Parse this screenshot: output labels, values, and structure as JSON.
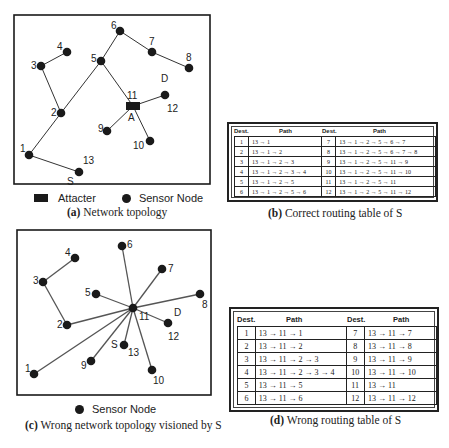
{
  "figure_a": {
    "label": "(a)",
    "caption": "Network topology",
    "legend": {
      "attacker_label": "Attacter",
      "sensor_label": "Sensor Node"
    },
    "nodes": [
      {
        "id": "1",
        "x": 29,
        "y": 155,
        "label": "1",
        "lx": -9,
        "ly": -6
      },
      {
        "id": "2",
        "x": 61,
        "y": 113,
        "label": "2",
        "lx": -10,
        "ly": 0
      },
      {
        "id": "3",
        "x": 41,
        "y": 66,
        "label": "3",
        "lx": -10,
        "ly": 0
      },
      {
        "id": "4",
        "x": 67,
        "y": 52,
        "label": "4",
        "lx": -10,
        "ly": -5
      },
      {
        "id": "5",
        "x": 101,
        "y": 61,
        "label": "5",
        "lx": -10,
        "ly": -2
      },
      {
        "id": "6",
        "x": 120,
        "y": 31,
        "label": "6",
        "lx": -9,
        "ly": -5
      },
      {
        "id": "7",
        "x": 152,
        "y": 52,
        "label": "7",
        "lx": -3,
        "ly": -10
      },
      {
        "id": "8",
        "x": 189,
        "y": 68,
        "label": "8",
        "lx": -3,
        "ly": -10
      },
      {
        "id": "9",
        "x": 107,
        "y": 131,
        "label": "9",
        "lx": -9,
        "ly": -2
      },
      {
        "id": "10",
        "x": 150,
        "y": 141,
        "label": "10",
        "lx": -17,
        "ly": 5
      },
      {
        "id": "12",
        "x": 165,
        "y": 95,
        "label": "12",
        "lx": 2,
        "ly": 14
      },
      {
        "id": "13",
        "x": 79,
        "y": 172,
        "label": "13",
        "lx": 4,
        "ly": -11
      }
    ],
    "attacker": {
      "id": "11",
      "x": 133,
      "y": 106,
      "label": "11",
      "sub": "A"
    },
    "extra_labels": [
      {
        "text": "D",
        "x": 161,
        "y": 82
      },
      {
        "text": "S",
        "x": 67,
        "y": 185
      }
    ],
    "edges": [
      [
        "13",
        "1"
      ],
      [
        "1",
        "2"
      ],
      [
        "2",
        "3"
      ],
      [
        "3",
        "4"
      ],
      [
        "2",
        "5"
      ],
      [
        "5",
        "6"
      ],
      [
        "6",
        "7"
      ],
      [
        "7",
        "8"
      ],
      [
        "5",
        "11"
      ],
      [
        "11",
        "12"
      ],
      [
        "11",
        "9"
      ],
      [
        "11",
        "10"
      ]
    ]
  },
  "figure_b": {
    "label": "(b)",
    "caption": "Correct routing table of S",
    "headers": {
      "dest": "Dest.",
      "path": "Path"
    },
    "left_rows": [
      {
        "dest": "1",
        "path": "13 → 1"
      },
      {
        "dest": "2",
        "path": "13 → 1 → 2"
      },
      {
        "dest": "3",
        "path": "13 → 1 → 2 → 3"
      },
      {
        "dest": "4",
        "path": "13 → 1 → 2 → 3 → 4"
      },
      {
        "dest": "5",
        "path": "13 → 1 → 2 → 5"
      },
      {
        "dest": "6",
        "path": "13 → 1 → 2 → 5 → 6"
      }
    ],
    "right_rows": [
      {
        "dest": "7",
        "path": "13 → 1 → 2 → 5 → 6 → 7"
      },
      {
        "dest": "8",
        "path": "13 → 1 → 2 → 5 → 6 → 7 → 8"
      },
      {
        "dest": "9",
        "path": "13 → 1 → 2 → 5 → 11 → 9"
      },
      {
        "dest": "10",
        "path": "13 → 1 → 2 → 5 → 11 → 10"
      },
      {
        "dest": "11",
        "path": "13 → 1 → 2 → 5 → 11"
      },
      {
        "dest": "12",
        "path": "13 → 1 → 2 → 5 → 11 → 12"
      }
    ]
  },
  "figure_c": {
    "label": "(c)",
    "caption": "Wrong network topology visioned by S",
    "legend": {
      "sensor_label": "Sensor Node"
    },
    "nodes": [
      {
        "id": "1",
        "x": 34,
        "y": 374,
        "label": "1",
        "lx": -9,
        "ly": -5
      },
      {
        "id": "2",
        "x": 67,
        "y": 325,
        "label": "2",
        "lx": -10,
        "ly": 0
      },
      {
        "id": "3",
        "x": 43,
        "y": 282,
        "label": "3",
        "lx": -10,
        "ly": -1
      },
      {
        "id": "4",
        "x": 75,
        "y": 258,
        "label": "4",
        "lx": -10,
        "ly": -5
      },
      {
        "id": "5",
        "x": 96,
        "y": 294,
        "label": "5",
        "lx": -11,
        "ly": -1
      },
      {
        "id": "6",
        "x": 122,
        "y": 246,
        "label": "6",
        "lx": 5,
        "ly": -1
      },
      {
        "id": "7",
        "x": 162,
        "y": 269,
        "label": "7",
        "lx": 6,
        "ly": 0
      },
      {
        "id": "8",
        "x": 200,
        "y": 294,
        "label": "8",
        "lx": 2,
        "ly": 11
      },
      {
        "id": "9",
        "x": 91,
        "y": 361,
        "label": "9",
        "lx": -10,
        "ly": 5
      },
      {
        "id": "10",
        "x": 152,
        "y": 370,
        "label": "10",
        "lx": 1,
        "ly": 11
      },
      {
        "id": "11",
        "x": 133,
        "y": 308,
        "label": "11",
        "lx": 6,
        "ly": 9
      },
      {
        "id": "12",
        "x": 168,
        "y": 323,
        "label": "12",
        "lx": 0,
        "ly": 14
      },
      {
        "id": "13",
        "x": 124,
        "y": 345,
        "label": "13",
        "lx": 4,
        "ly": 8
      }
    ],
    "extra_labels": [
      {
        "text": "D",
        "x": 174,
        "y": 316
      },
      {
        "text": "S",
        "x": 111,
        "y": 348
      }
    ],
    "edges": [
      [
        "3",
        "4"
      ],
      [
        "3",
        "2"
      ],
      [
        "2",
        "11"
      ],
      [
        "1",
        "11"
      ],
      [
        "5",
        "11"
      ],
      [
        "6",
        "11"
      ],
      [
        "7",
        "11"
      ],
      [
        "8",
        "11"
      ],
      [
        "9",
        "11"
      ],
      [
        "10",
        "11"
      ],
      [
        "12",
        "11"
      ],
      [
        "13",
        "11"
      ]
    ]
  },
  "figure_d": {
    "label": "(d)",
    "caption": "Wrong routing table of S",
    "headers": {
      "dest": "Dest.",
      "path": "Path"
    },
    "left_rows": [
      {
        "dest": "1",
        "path": "13 → 11 → 1"
      },
      {
        "dest": "2",
        "path": "13 → 11 → 2"
      },
      {
        "dest": "3",
        "path": "13 → 11 → 2 → 3"
      },
      {
        "dest": "4",
        "path": "13 → 11 → 2 → 3 → 4"
      },
      {
        "dest": "5",
        "path": "13 → 11 → 5"
      },
      {
        "dest": "6",
        "path": "13 → 11 → 6"
      }
    ],
    "right_rows": [
      {
        "dest": "7",
        "path": "13 → 11 → 7"
      },
      {
        "dest": "8",
        "path": "13 → 11 → 8"
      },
      {
        "dest": "9",
        "path": "13 → 11 → 9"
      },
      {
        "dest": "10",
        "path": "13 → 11 → 10"
      },
      {
        "dest": "11",
        "path": "13 → 11"
      },
      {
        "dest": "12",
        "path": "13 → 11 → 12"
      }
    ]
  }
}
